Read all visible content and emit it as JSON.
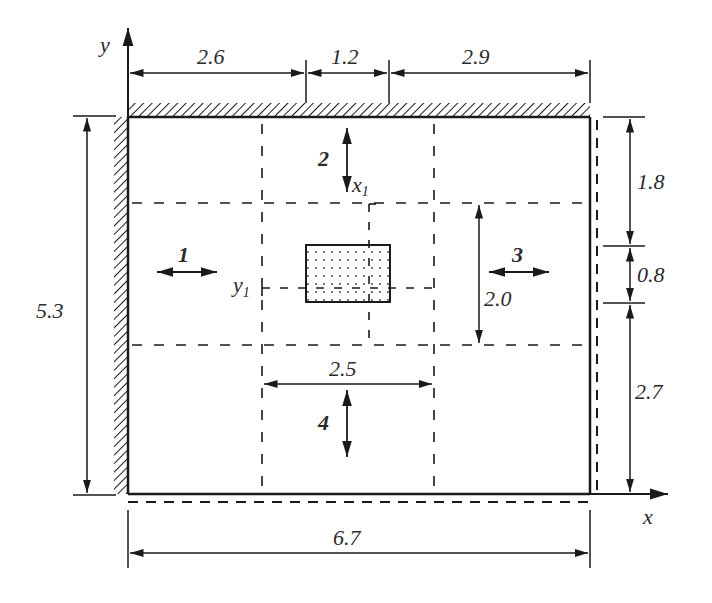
{
  "diagram": {
    "type": "plate-with-cutout-dimension-drawing",
    "axes": {
      "x": "x",
      "y": "y",
      "x1": "x",
      "x1_sub": "1",
      "y1": "y",
      "y1_sub": "1"
    },
    "dimensions": {
      "top": [
        "2.6",
        "1.2",
        "2.9"
      ],
      "bottom_total": "6.7",
      "left_total": "5.3",
      "right": [
        "1.8",
        "0.8",
        "2.7"
      ],
      "inner_height": "2.0",
      "inner_width": "2.5"
    },
    "zones": [
      "1",
      "2",
      "3",
      "4"
    ],
    "colors": {
      "line": "#1a1a1a",
      "text": "#2a2a2a",
      "background": "#ffffff"
    }
  }
}
